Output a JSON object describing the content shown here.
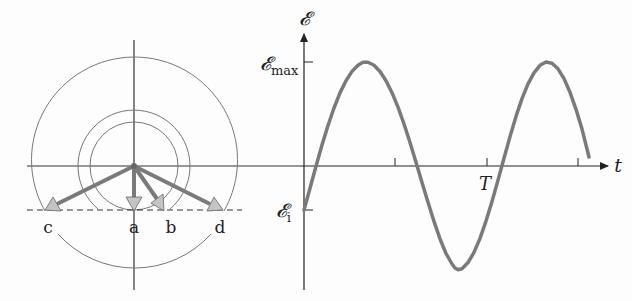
{
  "figure": {
    "type": "phasor-and-emf-waveform",
    "phasor_diagram": {
      "labels": [
        "c",
        "a",
        "b",
        "d"
      ],
      "reference_line_label": "𝓔i"
    },
    "waveform": {
      "y_axis_label": "𝓔",
      "x_axis_label": "t",
      "max_label_main": "𝓔",
      "max_label_sub": "max",
      "initial_label_main": "𝓔",
      "initial_label_sub": "i",
      "period_label": "T"
    },
    "colors": {
      "axis": "#333333",
      "circle": "#777777",
      "curve": "#7a7a7a",
      "phasor_shaft": "#7a7a7a",
      "phasor_head": "#c4c4c4"
    }
  }
}
